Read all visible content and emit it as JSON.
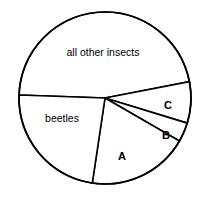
{
  "chart_data": {
    "type": "pie",
    "title": "",
    "subtitle": "",
    "xlabel": "",
    "ylabel": "",
    "grid": false,
    "legend": "none",
    "labels_position": "inside-slices",
    "center": {
      "x": 105,
      "y": 98
    },
    "radius": 86,
    "total_degrees": 360,
    "categories": [
      "all other insects",
      "C",
      "B",
      "A",
      "beetles"
    ],
    "values": [
      167,
      28,
      13,
      68.5,
      83.5
    ],
    "units": "degrees",
    "slices": [
      {
        "name": "all other insects",
        "label": "all other insects",
        "start_angle": 182,
        "end_angle": 349,
        "sweep": 167,
        "percent": 46.4,
        "fill": "#ffffff",
        "stroke": "#000000",
        "label_x": 103,
        "label_y": 53
      },
      {
        "name": "C",
        "label": "C",
        "start_angle": 349,
        "end_angle": 377,
        "sweep": 28,
        "percent": 7.8,
        "fill": "#ffffff",
        "stroke": "#000000",
        "label_x": 168,
        "label_y": 106
      },
      {
        "name": "B",
        "label": "B",
        "start_angle": 377,
        "end_angle": 390,
        "sweep": 13,
        "percent": 3.6,
        "fill": "#ffffff",
        "stroke": "#000000",
        "label_x": 166,
        "label_y": 136
      },
      {
        "name": "A",
        "label": "A",
        "start_angle": 390,
        "end_angle": 458.5,
        "sweep": 68.5,
        "percent": 19.0,
        "fill": "#ffffff",
        "stroke": "#000000",
        "label_x": 122,
        "label_y": 157
      },
      {
        "name": "beetles",
        "label": "beetles",
        "start_angle": 458.5,
        "end_angle": 542,
        "sweep": 83.5,
        "percent": 23.2,
        "fill": "#ffffff",
        "stroke": "#000000",
        "label_x": 62,
        "label_y": 119
      }
    ]
  },
  "figure": {
    "background": "#ffffff",
    "line_color": "#000000",
    "width": 209,
    "height": 198
  }
}
